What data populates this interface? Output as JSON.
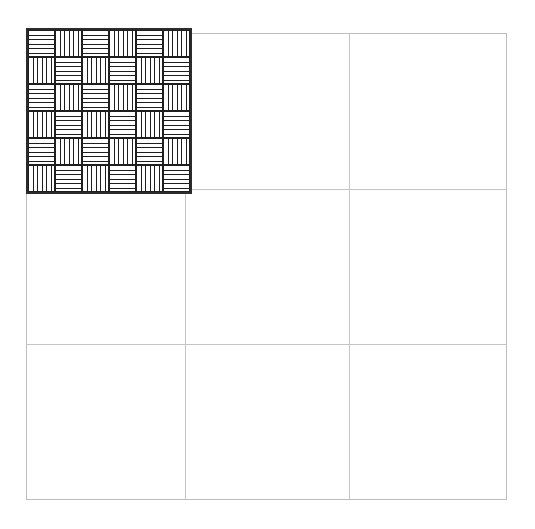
{
  "canvas": {
    "width": 535,
    "height": 529,
    "background": "#ffffff"
  },
  "grid": {
    "name": "reference-grid",
    "left": 26,
    "top": 33,
    "width": 481,
    "height": 467,
    "columns": 3,
    "rows": 3,
    "line_color": "#c4c4c4",
    "border_color": "#bdbdbd",
    "vertical_line_offsets": [
      159,
      323
    ],
    "horizontal_line_offsets": [
      156,
      311
    ]
  },
  "swatch": {
    "name": "basketweave-pattern-swatch",
    "label": "Basketweave hatch pattern",
    "left": 26,
    "top": 28,
    "width": 162,
    "height": 162,
    "border_color": "#2b2b2b",
    "border_width": 2,
    "fill_color": "#ffffff",
    "hatch_color": "#1e1e1e",
    "tile_size": 27,
    "tiles_across": 6,
    "tiles_down": 6,
    "lines_per_tile": 5,
    "tile_orientations": [
      [
        "horizontal",
        "vertical",
        "horizontal",
        "vertical",
        "horizontal",
        "vertical"
      ],
      [
        "vertical",
        "horizontal",
        "vertical",
        "horizontal",
        "vertical",
        "horizontal"
      ],
      [
        "horizontal",
        "vertical",
        "horizontal",
        "vertical",
        "horizontal",
        "vertical"
      ],
      [
        "vertical",
        "horizontal",
        "vertical",
        "horizontal",
        "vertical",
        "horizontal"
      ],
      [
        "horizontal",
        "vertical",
        "horizontal",
        "vertical",
        "horizontal",
        "vertical"
      ],
      [
        "vertical",
        "horizontal",
        "vertical",
        "horizontal",
        "vertical",
        "horizontal"
      ]
    ]
  }
}
